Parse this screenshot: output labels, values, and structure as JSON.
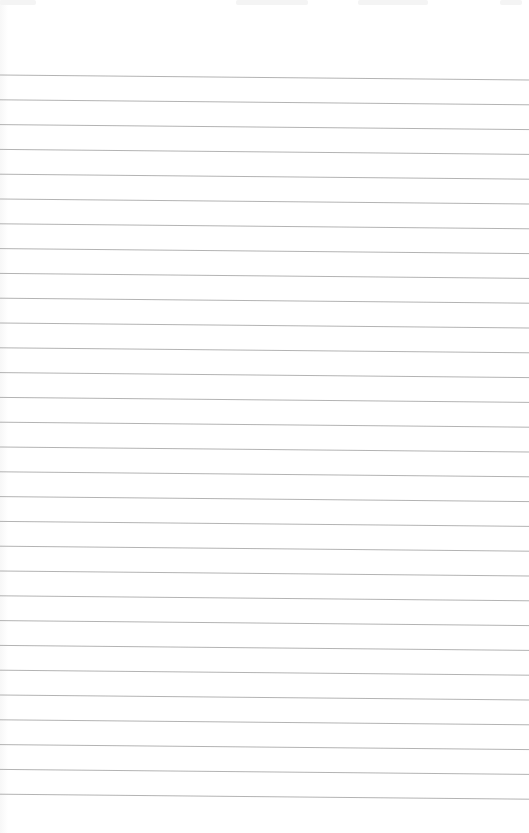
{
  "page": {
    "type": "ruled-paper",
    "background": "#ffffff",
    "line_color": "#9a9a9a",
    "line_count": 30,
    "first_line_y_left": 75,
    "first_line_y_right": 80,
    "line_spacing": 24.8
  }
}
